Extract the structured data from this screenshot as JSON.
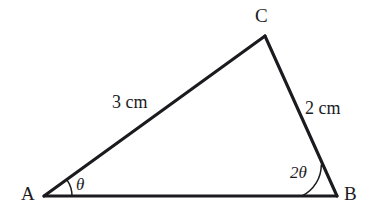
{
  "figure": {
    "type": "triangle-diagram",
    "stroke_color": "#1b1b1f",
    "background_color": "#ffffff",
    "vertices": [
      {
        "name": "A",
        "label": "A",
        "x": 44,
        "y": 196
      },
      {
        "name": "B",
        "label": "B",
        "x": 337,
        "y": 196
      },
      {
        "name": "C",
        "label": "C",
        "x": 265,
        "y": 36
      }
    ],
    "sides": [
      {
        "name": "AC",
        "label": "3 cm",
        "value": 3,
        "unit": "cm",
        "from": "A",
        "to": "C"
      },
      {
        "name": "CB",
        "label": "2 cm",
        "value": 2,
        "unit": "cm",
        "from": "C",
        "to": "B"
      },
      {
        "name": "AB",
        "label": "",
        "from": "A",
        "to": "B"
      }
    ],
    "angles": [
      {
        "at": "A",
        "label": "θ",
        "arc_radius": 28
      },
      {
        "at": "B",
        "label": "2θ",
        "arc_radius": 35
      }
    ]
  }
}
